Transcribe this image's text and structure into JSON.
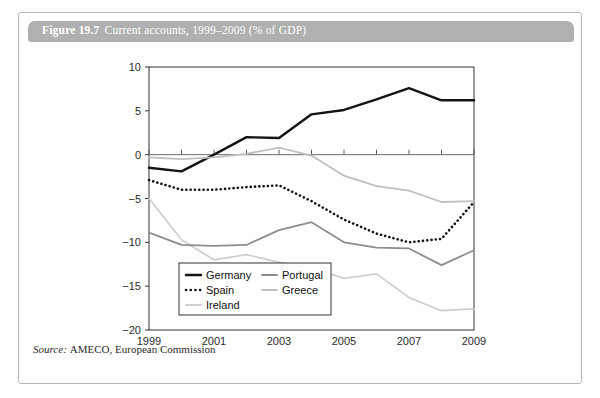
{
  "figure": {
    "number": "Figure 19.7",
    "caption": "Current accounts, 1999–2009 (% of GDP)",
    "source_label": "Source:",
    "source_value": "AMECO, European Commission"
  },
  "chart_data": {
    "type": "line",
    "title": "Current accounts, 1999–2009 (% of GDP)",
    "xlabel": "",
    "ylabel": "",
    "x": [
      1999,
      2000,
      2001,
      2002,
      2003,
      2004,
      2005,
      2006,
      2007,
      2008,
      2009
    ],
    "xlim": [
      1999,
      2009
    ],
    "ylim": [
      -20,
      10
    ],
    "xticks": [
      1999,
      2000,
      2001,
      2002,
      2003,
      2004,
      2005,
      2006,
      2007,
      2008,
      2009
    ],
    "xticklabels": [
      "1999",
      "",
      "2001",
      "",
      "2003",
      "",
      "2005",
      "",
      "2007",
      "",
      "2009"
    ],
    "yticks": [
      -20,
      -15,
      -10,
      -5,
      0,
      5,
      10
    ],
    "yticklabels": [
      "−20",
      "−15",
      "−10",
      "−5",
      "0",
      "5",
      "10"
    ],
    "grid": false,
    "zero_line": true,
    "legend_position": "lower-left-inside",
    "series": [
      {
        "name": "Germany",
        "color": "#141414",
        "width": 2.4,
        "dash": "none",
        "values": [
          -1.5,
          -1.9,
          0.0,
          2.0,
          1.9,
          4.6,
          5.1,
          6.3,
          7.6,
          6.2,
          6.2
        ]
      },
      {
        "name": "Spain",
        "color": "#141414",
        "width": 2.0,
        "dash": "dotted",
        "values": [
          -2.9,
          -4.0,
          -4.0,
          -3.7,
          -3.5,
          -5.3,
          -7.4,
          -9.0,
          -10.0,
          -9.6,
          -5.4
        ]
      },
      {
        "name": "Ireland",
        "color": "#cfcfcf",
        "width": 1.8,
        "dash": "none",
        "values": [
          -5.0,
          -9.7,
          -12.0,
          -11.4,
          -12.3,
          -12.9,
          -14.1,
          -13.6,
          -16.3,
          -17.8,
          -17.6
        ]
      },
      {
        "name": "Portugal",
        "color": "#8d8d8d",
        "width": 1.8,
        "dash": "none",
        "values": [
          -8.9,
          -10.3,
          -10.4,
          -10.3,
          -8.6,
          -7.7,
          -10.0,
          -10.6,
          -10.7,
          -12.6,
          -10.9
        ]
      },
      {
        "name": "Greece",
        "color": "#c0c0c0",
        "width": 1.8,
        "dash": "none",
        "values": [
          -0.3,
          -0.5,
          -0.3,
          0.1,
          0.8,
          -0.1,
          -2.4,
          -3.6,
          -4.1,
          -5.4,
          -5.3
        ]
      }
    ]
  },
  "legend": {
    "entries": [
      {
        "label": "Germany"
      },
      {
        "label": "Portugal"
      },
      {
        "label": "Spain"
      },
      {
        "label": "Greece"
      },
      {
        "label": "Ireland"
      }
    ]
  }
}
